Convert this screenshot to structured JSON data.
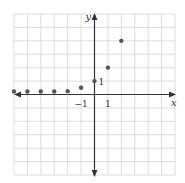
{
  "chart_data": {
    "type": "scatter",
    "title": "",
    "xlabel": "x",
    "ylabel": "y",
    "xlim": [
      -6,
      6
    ],
    "ylim": [
      -6,
      6
    ],
    "grid": true,
    "tick_labels": {
      "x": [
        {
          "value": -1,
          "label": "−1"
        },
        {
          "value": 1,
          "label": "1"
        }
      ],
      "y": [
        {
          "value": 1,
          "label": "1"
        }
      ]
    },
    "series": [
      {
        "name": "y = 2^x",
        "x": [
          -6,
          -5,
          -4,
          -3,
          -2,
          -1,
          0,
          1,
          2
        ],
        "y": [
          0.015625,
          0.03125,
          0.0625,
          0.125,
          0.25,
          0.5,
          1,
          2,
          4
        ]
      }
    ]
  },
  "colors": {
    "grid": "#d4d4d4",
    "axis": "#333333",
    "point": "#555555"
  }
}
